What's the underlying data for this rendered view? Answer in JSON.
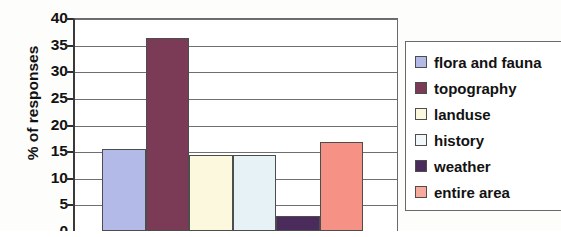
{
  "chart_data": {
    "type": "bar",
    "title": "",
    "xlabel": "",
    "ylabel": "% of responses",
    "ylim": [
      0,
      40
    ],
    "ytick_step": 5,
    "yticks": [
      40,
      35,
      30,
      25,
      20,
      15,
      10,
      5,
      0
    ],
    "ytick_labels": [
      "40",
      "35",
      "30",
      "25",
      "20",
      "15",
      "10",
      "5",
      "0"
    ],
    "grid": true,
    "legend_position": "right",
    "categories": [
      "flora and fauna",
      "topography",
      "landuse",
      "history",
      "weather",
      "entire area"
    ],
    "values": [
      15.4,
      36.3,
      14.3,
      14.3,
      2.9,
      16.8
    ],
    "colors": [
      "#b4bae8",
      "#7b3a55",
      "#fbf8dd",
      "#e6f2f6",
      "#4b2a5c",
      "#f59185"
    ],
    "series": [
      {
        "name": "% of responses",
        "values": [
          15.4,
          36.3,
          14.3,
          14.3,
          2.9,
          16.8
        ]
      }
    ],
    "annotations": []
  },
  "legend": {
    "items": [
      {
        "label": "flora and fauna",
        "color": "#b4bae8"
      },
      {
        "label": "topography",
        "color": "#7b3a55"
      },
      {
        "label": "landuse",
        "color": "#fbf8dd"
      },
      {
        "label": "history",
        "color": "#f2f7f9"
      },
      {
        "label": "weather",
        "color": "#4b2a5c"
      },
      {
        "label": "entire area",
        "color": "#f7a99c"
      }
    ]
  },
  "axis": {
    "y_title": "% of responses"
  }
}
